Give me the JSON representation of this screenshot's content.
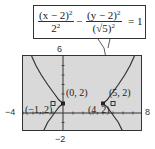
{
  "equation": {
    "term1_numerator": "(x − 2)",
    "term1_numerator_exp": "2",
    "term1_denominator": "2",
    "term1_denominator_exp": "2",
    "minus": "−",
    "term2_numerator": "(y − 2)",
    "term2_numerator_exp": "2",
    "term2_denominator": "(√5)",
    "term2_denominator_exp": "2",
    "equals": "= 1"
  },
  "window": {
    "xmin_label": "−4",
    "xmax_label": "8",
    "ymax_label": "6",
    "ymin_label": "−2",
    "xmin": -4,
    "xmax": 8,
    "ymin": -2,
    "ymax": 6
  },
  "points": [
    {
      "label": "(0, 2)",
      "x": 0,
      "y": 2,
      "marker": "filled"
    },
    {
      "label": "(4, 2)",
      "x": 4,
      "y": 2,
      "marker": "filled"
    },
    {
      "label": "(−1, 2)",
      "x": -1,
      "y": 2,
      "marker": "hollow"
    },
    {
      "label": "(5, 2)",
      "x": 5,
      "y": 2,
      "marker": "hollow"
    }
  ],
  "colors": {
    "screen_bg": "#d9d9d9",
    "curve": "#333333",
    "border": "#333333"
  }
}
